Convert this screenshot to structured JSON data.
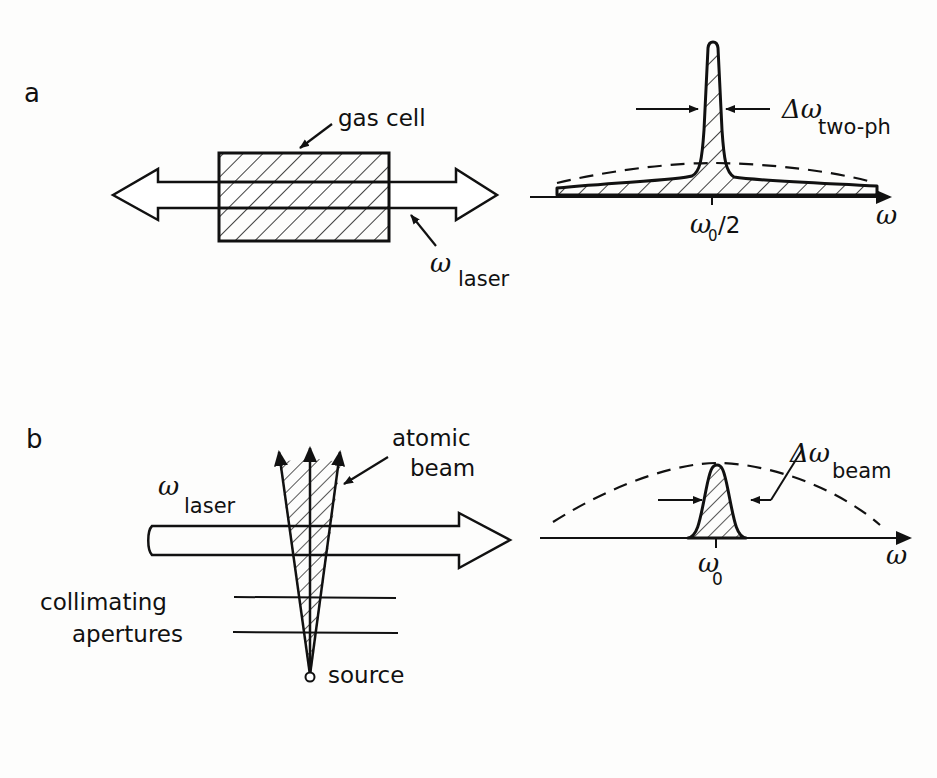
{
  "panels": [
    {
      "id": "a",
      "letter": "a",
      "setup": {
        "cell_label": "gas cell",
        "laser_symbol": "ω",
        "laser_subscript": "laser",
        "beam_direction": "counter-propagating (double-headed arrow)"
      },
      "spectrum": {
        "linewidth_symbol": "Δω",
        "linewidth_subscript": "two-ph",
        "center_tick_label_symbol": "ω",
        "center_tick_label_subscript": "0",
        "center_tick_label_suffix": "/2",
        "axis_label": "ω",
        "profile": "narrow Doppler-free peak on broad pedestal; dashed Doppler envelope"
      }
    },
    {
      "id": "b",
      "letter": "b",
      "setup": {
        "beam_label_line1": "atomic",
        "beam_label_line2": "beam",
        "laser_symbol": "ω",
        "laser_subscript": "laser",
        "aperture_label_line1": "collimating",
        "aperture_label_line2": "apertures",
        "source_label": "source"
      },
      "spectrum": {
        "linewidth_symbol": "Δω",
        "linewidth_subscript": "beam",
        "center_tick_label_symbol": "ω",
        "center_tick_label_subscript": "0",
        "axis_label": "ω",
        "profile": "narrow peak under broad dashed Doppler envelope"
      }
    }
  ],
  "colors": {
    "ink": "#111111",
    "paper": "#fdfdfc"
  }
}
